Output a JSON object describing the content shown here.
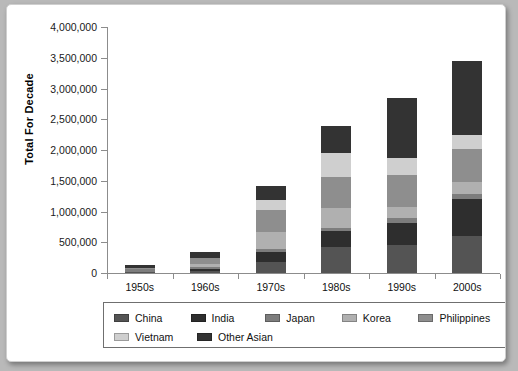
{
  "chart": {
    "type": "bar",
    "title": "",
    "ylabel": "Total For Decade",
    "xlabel": ""
  },
  "chart_data": {
    "type": "bar",
    "stacked": true,
    "title": "",
    "xlabel": "",
    "ylabel": "Total For Decade",
    "ylim": [
      0,
      4000000
    ],
    "ytick_labels": [
      "4,000,000",
      "3,500,000",
      "3,000,000",
      "2,500,000",
      "2,000,000",
      "1,500,000",
      "1,000,000",
      "500,000",
      "0"
    ],
    "ytick_values": [
      4000000,
      3500000,
      3000000,
      2500000,
      2000000,
      1500000,
      1000000,
      500000,
      0
    ],
    "grid": false,
    "legend_position": "bottom",
    "categories": [
      "1950s",
      "1960s",
      "1970s",
      "1980s",
      "1990s",
      "2000s"
    ],
    "series": [
      {
        "name": "China",
        "color": "#545454",
        "values": [
          15000,
          35000,
          180000,
          420000,
          460000,
          600000
        ]
      },
      {
        "name": "India",
        "color": "#2e2e2e",
        "values": [
          2000,
          30000,
          160000,
          260000,
          360000,
          600000
        ]
      },
      {
        "name": "Japan",
        "color": "#7d7d7d",
        "values": [
          45000,
          40000,
          50000,
          45000,
          70000,
          90000
        ]
      },
      {
        "name": "Korea",
        "color": "#b0b0b0",
        "values": [
          6000,
          35000,
          270000,
          330000,
          180000,
          190000
        ]
      },
      {
        "name": "Philippines",
        "color": "#8e8e8e",
        "values": [
          20000,
          100000,
          360000,
          500000,
          520000,
          540000
        ]
      },
      {
        "name": "Vietnam",
        "color": "#cfcfcf",
        "values": [
          2000,
          5000,
          170000,
          400000,
          280000,
          230000
        ]
      },
      {
        "name": "Other Asian",
        "color": "#333333",
        "values": [
          40000,
          105000,
          230000,
          430000,
          980000,
          1200000
        ]
      }
    ],
    "totals": [
      130000,
      350000,
      1420000,
      2385000,
      2850000,
      3450000
    ]
  },
  "legend": {
    "items": [
      {
        "label": "China"
      },
      {
        "label": "India"
      },
      {
        "label": "Japan"
      },
      {
        "label": "Korea"
      },
      {
        "label": "Philippines"
      },
      {
        "label": "Vietnam"
      },
      {
        "label": "Other Asian"
      }
    ]
  }
}
